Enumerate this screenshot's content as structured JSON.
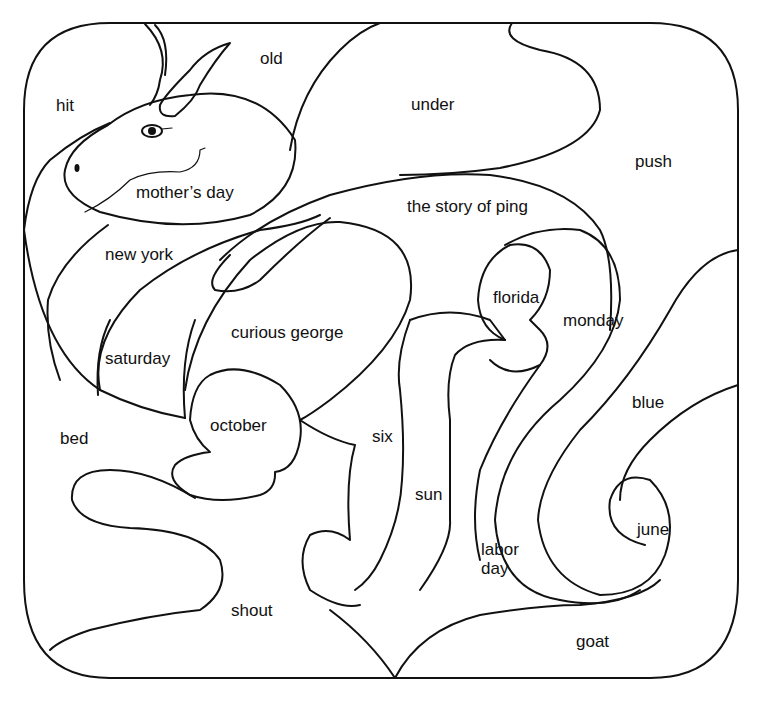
{
  "page": {
    "type": "coloring worksheet"
  },
  "words": [
    {
      "id": "hit",
      "text": "hit",
      "x": 56,
      "y": 96
    },
    {
      "id": "old",
      "text": "old",
      "x": 260,
      "y": 49
    },
    {
      "id": "under",
      "text": "under",
      "x": 411,
      "y": 95
    },
    {
      "id": "push",
      "text": "push",
      "x": 635,
      "y": 152
    },
    {
      "id": "mothers-day",
      "text": "mother’s day",
      "x": 136,
      "y": 183
    },
    {
      "id": "the-story-of-ping",
      "text": "the story of ping",
      "x": 407,
      "y": 197
    },
    {
      "id": "new-york",
      "text": "new york",
      "x": 105,
      "y": 245
    },
    {
      "id": "florida",
      "text": "florida",
      "x": 493,
      "y": 288
    },
    {
      "id": "monday",
      "text": "monday",
      "x": 563,
      "y": 311
    },
    {
      "id": "curious-george",
      "text": "curious george",
      "x": 231,
      "y": 323
    },
    {
      "id": "saturday",
      "text": "saturday",
      "x": 105,
      "y": 349
    },
    {
      "id": "blue",
      "text": "blue",
      "x": 632,
      "y": 393
    },
    {
      "id": "october",
      "text": "october",
      "x": 210,
      "y": 416
    },
    {
      "id": "bed",
      "text": "bed",
      "x": 60,
      "y": 429
    },
    {
      "id": "six",
      "text": "six",
      "x": 372,
      "y": 427
    },
    {
      "id": "sun",
      "text": "sun",
      "x": 415,
      "y": 485
    },
    {
      "id": "june",
      "text": "june",
      "x": 637,
      "y": 520
    },
    {
      "id": "labor-day",
      "text": "labor\nday",
      "x": 481,
      "y": 540
    },
    {
      "id": "shout",
      "text": "shout",
      "x": 231,
      "y": 601
    },
    {
      "id": "goat",
      "text": "goat",
      "x": 576,
      "y": 632
    }
  ]
}
